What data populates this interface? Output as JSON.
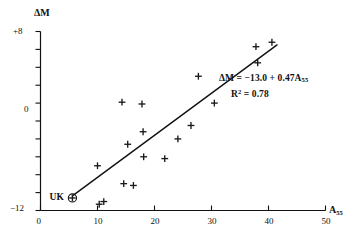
{
  "figure": {
    "axes": {
      "y_title": "ΔM",
      "x_title_main": "A",
      "x_title_sub": "55",
      "y_tick_labels": [
        "+8",
        "0",
        "−12"
      ],
      "x_tick_labels": [
        "0",
        "10",
        "20",
        "30",
        "40",
        "50"
      ]
    },
    "annotations": {
      "equation_prefix": "ΔM = −13.0 + 0.47A",
      "equation_subscript": "55",
      "r2_prefix": "R",
      "r2_sup": "2",
      "r2_value": " = 0.78",
      "uk_label": "UK"
    },
    "colors": {
      "axis": "#111111",
      "marker": "#1a1a1a",
      "fit_line": "#111111",
      "background": "#ffffff"
    }
  },
  "chart_data": {
    "type": "scatter",
    "title": "",
    "xlabel": "A55",
    "ylabel": "ΔM",
    "xlim": [
      0,
      50
    ],
    "ylim": [
      -12,
      8
    ],
    "grid": false,
    "legend": null,
    "x_ticks": [
      0,
      10,
      20,
      30,
      40,
      50
    ],
    "y_ticks": [
      -12,
      -10,
      -8,
      -6,
      -4,
      -2,
      0,
      2,
      4,
      6,
      8
    ],
    "y_labeled_ticks": [
      -12,
      0,
      8
    ],
    "points": [
      {
        "x": 10.0,
        "y": -7.0
      },
      {
        "x": 10.3,
        "y": -11.3
      },
      {
        "x": 11.1,
        "y": -11.0
      },
      {
        "x": 14.3,
        "y": 0.1
      },
      {
        "x": 14.6,
        "y": -9.0
      },
      {
        "x": 15.3,
        "y": -4.6
      },
      {
        "x": 16.3,
        "y": -9.2
      },
      {
        "x": 17.8,
        "y": -0.1
      },
      {
        "x": 18.0,
        "y": -3.2
      },
      {
        "x": 18.1,
        "y": -6.0
      },
      {
        "x": 21.8,
        "y": -6.2
      },
      {
        "x": 24.1,
        "y": -4.0
      },
      {
        "x": 26.4,
        "y": -2.5
      },
      {
        "x": 27.7,
        "y": 3.0
      },
      {
        "x": 30.5,
        "y": 0.0
      },
      {
        "x": 37.8,
        "y": 6.3
      },
      {
        "x": 38.1,
        "y": 4.5
      },
      {
        "x": 40.6,
        "y": 6.8
      }
    ],
    "highlighted_point": {
      "label": "UK",
      "x": 5.6,
      "y": -10.6,
      "marker": "circled-plus"
    },
    "fit_line": {
      "equation": "ΔM = -13.0 + 0.47*A55",
      "intercept": -13.0,
      "slope": 0.47,
      "r_squared": 0.78,
      "x_start": 5.6,
      "x_end": 41.5
    }
  }
}
